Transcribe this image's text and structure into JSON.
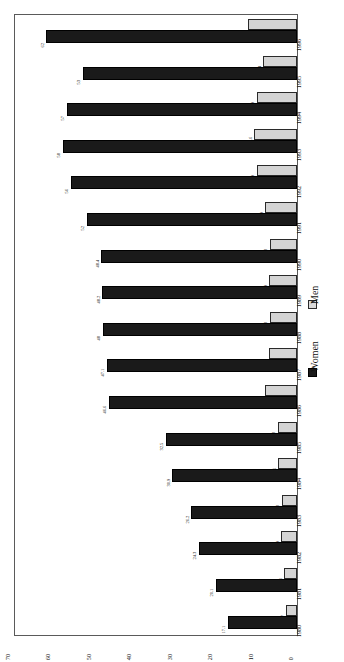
{
  "chart_data": {
    "type": "bar",
    "title": "",
    "subtitle": "",
    "xlabel": "",
    "ylabel": "",
    "orientation": "horizontal-rotated",
    "grid": false,
    "legend_position": "right-middle",
    "axis_range": [
      0,
      70
    ],
    "axis_ticks": [
      "0",
      "10",
      "20",
      "30",
      "40",
      "50",
      "60",
      "70"
    ],
    "axis_tick_values": [
      0,
      10,
      20,
      30,
      40,
      50,
      60,
      70
    ],
    "categories": [
      "1980",
      "1981",
      "1982",
      "1983",
      "1984",
      "1985",
      "1986",
      "1987",
      "1988",
      "1989",
      "1990",
      "1991",
      "1992",
      "1993",
      "1994",
      "1995",
      "1996"
    ],
    "series": [
      {
        "name": "Women",
        "color": "#1a1a1a",
        "values": [
          17.1,
          20.1,
          24.3,
          26.2,
          30.9,
          32.5,
          46.6,
          47.1,
          48,
          48.2,
          48.4,
          52,
          56,
          58,
          57,
          53,
          62
        ],
        "labels": [
          "17.1",
          "20.1",
          "24.3",
          "26.2",
          "30.9",
          "32.5",
          "46.6",
          "47.1",
          "48",
          "48.2",
          "48.4",
          "52",
          "56",
          "58",
          "57",
          "53",
          "62"
        ]
      },
      {
        "name": "Men",
        "color": "#d4d4d4",
        "values": [
          2.7,
          3.1,
          3.9,
          3.8,
          4.6,
          4.8,
          8,
          7,
          6.8,
          6.9,
          6.8,
          7.9,
          9.9,
          10.6,
          9.9,
          8.4,
          12
        ],
        "labels": [
          "2.7",
          "3.1",
          "3.9",
          "3.8",
          "4.6",
          "4.8",
          "8",
          "7",
          "6.8",
          "6.9",
          "6.8",
          "7.9",
          "9.9",
          "10.6",
          "9.9",
          "8.4",
          "12"
        ]
      }
    ]
  },
  "legend": {
    "entries": [
      {
        "label": "Women",
        "color": "#1a1a1a"
      },
      {
        "label": "Men",
        "color": "#d4d4d4"
      }
    ]
  }
}
